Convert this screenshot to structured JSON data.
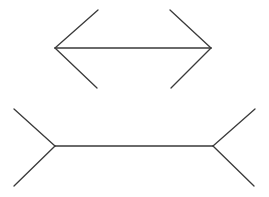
{
  "diagram": {
    "title": "",
    "figures": [
      {
        "name": "inward-arrowheads",
        "shaft": {
          "x1": 55,
          "y1": 48,
          "x2": 211,
          "y2": 48
        },
        "fins": [
          {
            "x1": 55,
            "y1": 48,
            "x2": 98,
            "y2": 10
          },
          {
            "x1": 55,
            "y1": 48,
            "x2": 97,
            "y2": 88
          },
          {
            "x1": 211,
            "y1": 48,
            "x2": 170,
            "y2": 10
          },
          {
            "x1": 211,
            "y1": 48,
            "x2": 171,
            "y2": 88
          }
        ]
      },
      {
        "name": "outward-fins",
        "shaft": {
          "x1": 55,
          "y1": 146,
          "x2": 213,
          "y2": 146
        },
        "fins": [
          {
            "x1": 55,
            "y1": 146,
            "x2": 14,
            "y2": 109
          },
          {
            "x1": 55,
            "y1": 146,
            "x2": 14,
            "y2": 186
          },
          {
            "x1": 213,
            "y1": 146,
            "x2": 255,
            "y2": 109
          },
          {
            "x1": 213,
            "y1": 146,
            "x2": 254,
            "y2": 186
          }
        ]
      }
    ],
    "stroke_color": "#3a3a3a",
    "background": "#ffffff"
  }
}
